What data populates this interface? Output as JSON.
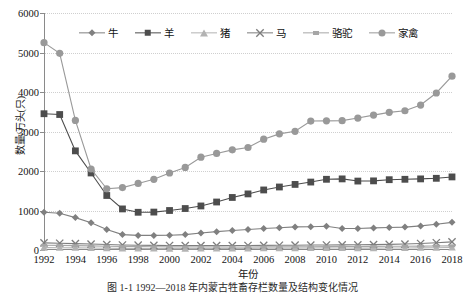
{
  "chart_data": {
    "type": "line",
    "title": "",
    "xlabel": "年份",
    "ylabel": "数量/万头(只)",
    "ylim": [
      0,
      6000
    ],
    "ytick_values": [
      0,
      1000,
      2000,
      3000,
      4000,
      5000,
      6000
    ],
    "ytick_labels": [
      "0",
      "1000",
      "2000",
      "3000",
      "4000",
      "5000",
      "6000"
    ],
    "xlim": [
      1992,
      2018
    ],
    "x": [
      1992,
      1993,
      1994,
      1995,
      1996,
      1997,
      1998,
      1999,
      2000,
      2001,
      2002,
      2003,
      2004,
      2005,
      2006,
      2007,
      2008,
      2009,
      2010,
      2011,
      2012,
      2013,
      2014,
      2015,
      2016,
      2017,
      2018
    ],
    "xtick_labels": [
      "1992",
      "1994",
      "1996",
      "1998",
      "2000",
      "2002",
      "2004",
      "2006",
      "2008",
      "2010",
      "2012",
      "2014",
      "2016",
      "2018"
    ],
    "grid": true,
    "legend_position": "top-center",
    "series": [
      {
        "name": "牛",
        "marker": "diamond",
        "color": "#808080",
        "values": [
          955,
          930,
          820,
          690,
          520,
          390,
          370,
          370,
          375,
          390,
          430,
          465,
          495,
          520,
          545,
          565,
          585,
          590,
          600,
          545,
          545,
          560,
          570,
          580,
          610,
          650,
          700
        ]
      },
      {
        "name": "羊",
        "marker": "square",
        "color": "#4d4d4d",
        "values": [
          3450,
          3430,
          2510,
          1950,
          1380,
          1040,
          955,
          960,
          1000,
          1050,
          1115,
          1215,
          1330,
          1420,
          1520,
          1595,
          1660,
          1720,
          1790,
          1800,
          1745,
          1750,
          1780,
          1790,
          1800,
          1815,
          1850
        ]
      },
      {
        "name": "猪",
        "marker": "triangle",
        "color": "#b3b3b3",
        "values": [
          60,
          58,
          55,
          50,
          45,
          40,
          38,
          36,
          35,
          35,
          36,
          38,
          40,
          42,
          44,
          46,
          48,
          50,
          52,
          50,
          48,
          48,
          50,
          52,
          55,
          58,
          62
        ]
      },
      {
        "name": "马",
        "marker": "x",
        "color": "#7d7d7d",
        "values": [
          180,
          172,
          162,
          150,
          138,
          128,
          122,
          118,
          115,
          113,
          112,
          112,
          113,
          115,
          118,
          120,
          122,
          125,
          128,
          130,
          132,
          136,
          142,
          150,
          165,
          185,
          205
        ]
      },
      {
        "name": "骆驼",
        "marker": "dash",
        "color": "#a6a6a6",
        "values": [
          120,
          116,
          110,
          104,
          96,
          90,
          86,
          83,
          80,
          78,
          77,
          76,
          76,
          77,
          78,
          80,
          82,
          84,
          86,
          88,
          90,
          92,
          94,
          96,
          98,
          100,
          104
        ]
      },
      {
        "name": "家禽",
        "marker": "circle",
        "color": "#999999",
        "values": [
          5250,
          4980,
          3280,
          2050,
          1550,
          1580,
          1685,
          1790,
          1950,
          2090,
          2350,
          2445,
          2535,
          2595,
          2805,
          2940,
          3005,
          3265,
          3270,
          3275,
          3340,
          3415,
          3485,
          3525,
          3670,
          3975,
          4400
        ]
      }
    ]
  },
  "caption": "图 1-1  1992—2018 年内蒙古牲畜存栏数量及结构变化情况"
}
